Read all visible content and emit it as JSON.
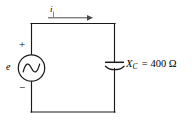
{
  "figure": {
    "type": "circuit-schematic",
    "background_color": "#ffffff",
    "line_color": "#1a1a1a"
  },
  "source": {
    "kind": "ac-voltage-source",
    "symbol_label": "e",
    "plus_label": "+",
    "minus_label": "−"
  },
  "current": {
    "label": "i",
    "direction": "clockwise-right"
  },
  "capacitor": {
    "kind": "capacitor",
    "symbol": "X",
    "subscript": "C",
    "equals": "=",
    "value": "400",
    "unit": "Ω",
    "full_label": "X_C = 400 Ω"
  }
}
